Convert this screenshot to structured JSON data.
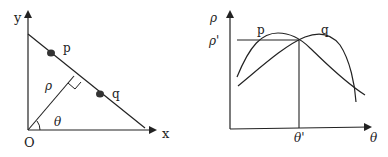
{
  "left_panel": {
    "axis_x_label": "x",
    "axis_y_label": "y",
    "origin_label": "O",
    "point_p_label": "p",
    "point_q_label": "q",
    "rho_label": "ρ",
    "theta_label": "θ"
  },
  "right_panel": {
    "axis_y_label": "ρ",
    "axis_x_label": "θ",
    "rho_prime_label": "ρ'",
    "theta_prime_label": "θ'",
    "curve_p_label": "p",
    "curve_q_label": "q"
  },
  "colors": {
    "stroke": "#222222",
    "point_fill": "#333333",
    "background": "#ffffff"
  }
}
